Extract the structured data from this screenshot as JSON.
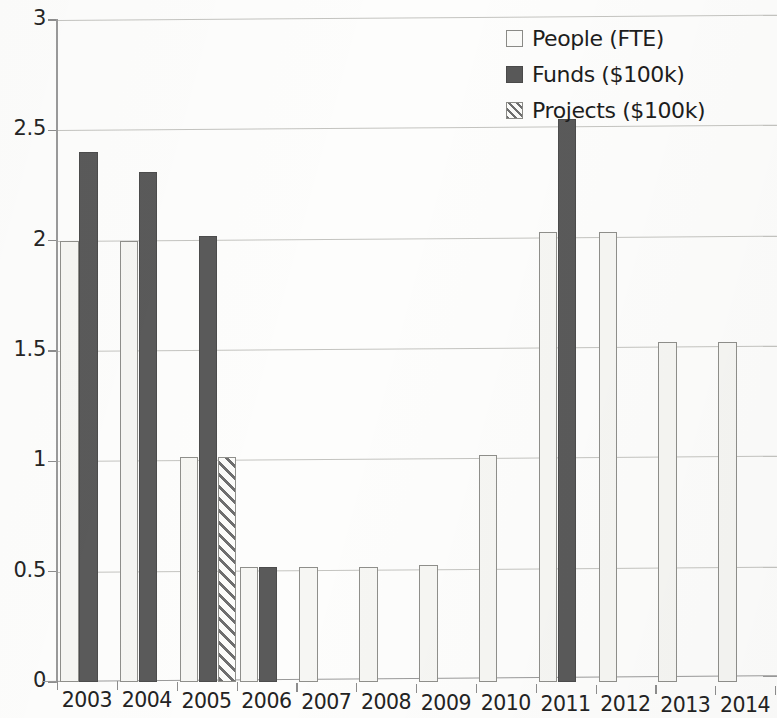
{
  "chart_data": {
    "type": "bar",
    "title": "",
    "subtitle": "",
    "xlabel": "",
    "ylabel": "",
    "categories": [
      "2003",
      "2004",
      "2005",
      "2006",
      "2007",
      "2008",
      "2009",
      "2010",
      "2011",
      "2012",
      "2013",
      "2014"
    ],
    "series": [
      {
        "name": "People (FTE)",
        "values": [
          2.0,
          2.0,
          1.02,
          0.52,
          0.52,
          0.52,
          0.53,
          1.03,
          2.04,
          2.04,
          1.54,
          1.54
        ],
        "fill": "#f6f6f3",
        "pattern": "solid-light",
        "border": "#8f8f8b"
      },
      {
        "name": "Funds ($100k)",
        "values": [
          2.4,
          2.31,
          2.02,
          0.52,
          null,
          null,
          null,
          null,
          2.55,
          null,
          null,
          null
        ],
        "fill": "#5a5a5a",
        "pattern": "solid-dark",
        "border": "#4c4c4c"
      },
      {
        "name": "Projects ($100k)",
        "values": [
          null,
          null,
          1.02,
          null,
          null,
          null,
          null,
          null,
          null,
          null,
          null,
          null
        ],
        "fill": "#f6f6f3",
        "pattern": "diagonal-hatch",
        "border": "#8f8f8b"
      }
    ],
    "yticks": [
      0,
      0.5,
      1,
      1.5,
      2,
      2.5,
      3
    ],
    "ytick_labels": [
      "0",
      "0.5",
      "1",
      "1.5",
      "2",
      "2.5",
      "3"
    ],
    "ylim": [
      0,
      3
    ],
    "grid": true,
    "grid_axis": "y",
    "legend_position": "top-right"
  },
  "legend": {
    "items": [
      {
        "label": "People (FTE)",
        "swatch": "people"
      },
      {
        "label": "Funds ($100k)",
        "swatch": "funds"
      },
      {
        "label": "Projects ($100k)",
        "swatch": "projects"
      }
    ]
  }
}
